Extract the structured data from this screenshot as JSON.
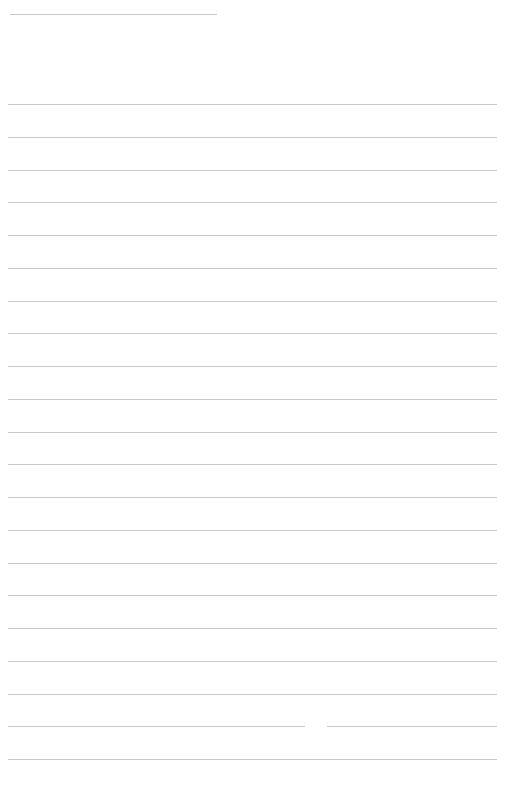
{
  "page": {
    "type": "blank lined paper",
    "background_color": "#ffffff",
    "line_color": "#c9c9c9"
  },
  "header_line": {
    "x_start": 10,
    "x_end": 217,
    "y": 14
  },
  "ruled_lines": {
    "count": 21,
    "x_start": 8,
    "x_end": 497,
    "first_y": 104,
    "spacing": 32.75
  },
  "line_gap": {
    "line_index": 19,
    "x_start": 305,
    "x_end": 327
  }
}
